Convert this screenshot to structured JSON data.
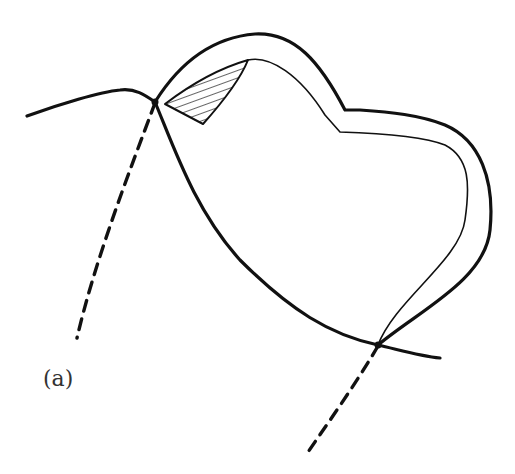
{
  "figure": {
    "panel_label": "(a)",
    "colors": {
      "stroke": "#111111",
      "background": "#ffffff"
    },
    "elements": [
      "gum-line-curve",
      "outer-crown-outline",
      "inner-crown-outline",
      "hatched-region",
      "upper-dashed-line",
      "lower-dashed-line"
    ]
  }
}
